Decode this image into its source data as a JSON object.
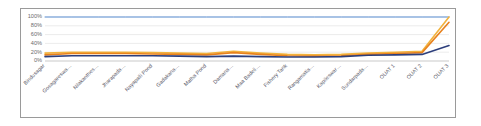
{
  "chart_data": {
    "type": "line",
    "title": "",
    "xlabel": "",
    "ylabel": "",
    "ylim": [
      0,
      100
    ],
    "yticks": [
      "0%",
      "20%",
      "40%",
      "60%",
      "80%",
      "100%"
    ],
    "grid": true,
    "legend": "none",
    "categories": [
      "Bindusagar",
      "Gosagareswa…",
      "Nilakanthes…",
      "Jharapada…",
      "Nayapalli Pond",
      "Gadakana…",
      "Matha Pond",
      "Damana…",
      "Maa Badeli…",
      "Fishery Tank",
      "Rangamatia…",
      "Kapileswar…",
      "Sundarpada…",
      "OUAT 1",
      "OUAT 2",
      "OUAT 3"
    ],
    "series": [
      {
        "name": "series-1",
        "color": "#5b8fd4",
        "values": [
          100,
          100,
          100,
          100,
          100,
          100,
          100,
          100,
          100,
          100,
          100,
          100,
          100,
          100,
          100,
          100
        ]
      },
      {
        "name": "series-2",
        "color": "#f2b33d",
        "values": [
          18,
          20,
          20,
          20,
          19,
          18,
          17,
          22,
          18,
          15,
          14,
          15,
          18,
          20,
          22,
          100
        ]
      },
      {
        "name": "series-3",
        "color": "#e8821e",
        "values": [
          14,
          17,
          17,
          17,
          16,
          15,
          14,
          19,
          15,
          12,
          11,
          12,
          15,
          17,
          19,
          88
        ]
      },
      {
        "name": "series-4",
        "color": "#2d3f7c",
        "values": [
          10,
          12,
          12,
          12,
          12,
          11,
          10,
          11,
          10,
          9,
          9,
          10,
          13,
          14,
          15,
          35
        ]
      }
    ]
  },
  "axes": {
    "ytick_labels": [
      "100%",
      "80%",
      "60%",
      "40%",
      "20%",
      "0%"
    ]
  }
}
